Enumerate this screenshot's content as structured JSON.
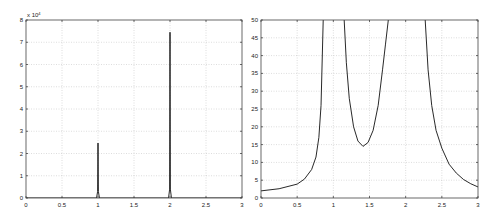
{
  "chart_data": [
    {
      "type": "line",
      "title": "",
      "xlabel": "",
      "ylabel": "",
      "y_multiplier_label": "x 10",
      "y_multiplier_exponent": "4",
      "xlim": [
        0,
        3
      ],
      "ylim": [
        0,
        8
      ],
      "x_ticks": [
        "0",
        "0.5",
        "1",
        "1.5",
        "2",
        "2.5",
        "3"
      ],
      "y_ticks": [
        "0",
        "1",
        "2",
        "3",
        "4",
        "5",
        "6",
        "7",
        "8"
      ],
      "grid": true,
      "series": [
        {
          "name": "spectrum",
          "x": [
            0,
            0.98,
            0.995,
            1.0,
            1.005,
            1.02,
            1.98,
            1.995,
            2.0,
            2.005,
            2.02,
            3
          ],
          "y": [
            0,
            0,
            0.3,
            2.47,
            0.3,
            0,
            0,
            0.4,
            7.45,
            0.4,
            0,
            0
          ]
        }
      ]
    },
    {
      "type": "line",
      "title": "",
      "xlabel": "",
      "ylabel": "",
      "xlim": [
        0,
        3
      ],
      "ylim": [
        0,
        50
      ],
      "x_ticks": [
        "0",
        "0.5",
        "1",
        "1.5",
        "2",
        "2.5",
        "3"
      ],
      "y_ticks": [
        "0",
        "5",
        "10",
        "15",
        "20",
        "25",
        "30",
        "35",
        "40",
        "45",
        "50"
      ],
      "grid": true,
      "series": [
        {
          "name": "segment-1",
          "x": [
            0,
            0.25,
            0.5,
            0.6,
            0.7,
            0.76,
            0.8,
            0.83,
            0.86
          ],
          "y": [
            2.0,
            2.6,
            3.9,
            5.3,
            8.0,
            11.5,
            17,
            26,
            50
          ]
        },
        {
          "name": "segment-2",
          "x": [
            1.15,
            1.18,
            1.22,
            1.28,
            1.34,
            1.41,
            1.48,
            1.55,
            1.62,
            1.68,
            1.72,
            1.76
          ],
          "y": [
            50,
            38,
            28,
            20,
            16,
            14.5,
            15.6,
            19,
            26,
            36,
            43,
            50
          ]
        },
        {
          "name": "segment-3",
          "x": [
            2.27,
            2.31,
            2.36,
            2.42,
            2.5,
            2.6,
            2.7,
            2.8,
            2.9,
            3.0
          ],
          "y": [
            50,
            36,
            26,
            19,
            14,
            9.5,
            7,
            5.2,
            4.0,
            3.1
          ]
        }
      ]
    }
  ]
}
